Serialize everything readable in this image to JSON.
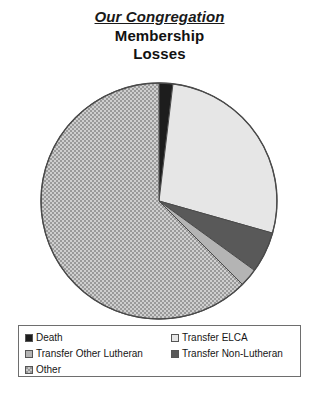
{
  "title": {
    "line1": "Our Congregation",
    "line2": "Membership",
    "line3": "Losses"
  },
  "colors": {
    "death": "#1d1d1d",
    "transfer_elca": "#e6e6e6",
    "transfer_other_lutheran": "#b4b4b4",
    "transfer_non_lutheran": "#595959",
    "other": "#9a9a9a",
    "outline": "#4a4a4a",
    "legend_border": "#6e6e6e"
  },
  "legend": {
    "left_column": [
      {
        "label": "Death",
        "swatch": "death"
      },
      {
        "label": "Transfer Other Lutheran",
        "swatch": "other-luth"
      },
      {
        "label": "Other",
        "swatch": "other"
      }
    ],
    "right_column": [
      {
        "label": "Transfer ELCA",
        "swatch": "elca"
      },
      {
        "label": "Transfer Non-Lutheran",
        "swatch": "nonluth"
      }
    ]
  },
  "chart_data": {
    "type": "pie",
    "title": "Our Congregation Membership Losses",
    "xlabel": "",
    "ylabel": "",
    "grid": false,
    "legend_position": "bottom",
    "start_angle_deg": 0,
    "direction": "clockwise",
    "categories": [
      "Death",
      "Transfer ELCA",
      "Transfer Non-Lutheran",
      "Transfer Other Lutheran",
      "Other"
    ],
    "values": [
      1.9,
      27.5,
      5.6,
      2.5,
      62.5
    ],
    "unit": "percent",
    "slices": [
      {
        "label": "Death",
        "value": 1.9,
        "angle_deg": 6.8,
        "color": "#1d1d1d",
        "pattern": "solid"
      },
      {
        "label": "Transfer ELCA",
        "value": 27.5,
        "angle_deg": 99.0,
        "color": "#e6e6e6",
        "pattern": "solid"
      },
      {
        "label": "Transfer Non-Lutheran",
        "value": 5.6,
        "angle_deg": 20.2,
        "color": "#595959",
        "pattern": "solid"
      },
      {
        "label": "Transfer Other Lutheran",
        "value": 2.5,
        "angle_deg": 9.0,
        "color": "#b4b4b4",
        "pattern": "solid"
      },
      {
        "label": "Other",
        "value": 62.5,
        "angle_deg": 225.0,
        "color": "#9a9a9a",
        "pattern": "checkered"
      }
    ]
  }
}
